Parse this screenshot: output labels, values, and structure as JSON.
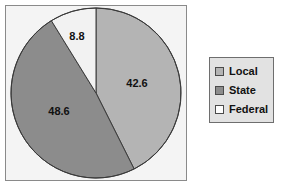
{
  "chart_data": {
    "type": "pie",
    "title": "",
    "subtitle": "",
    "xlabel": "",
    "ylabel": "",
    "grid": false,
    "legend_position": "right",
    "start_angle_deg": 0,
    "direction": "clockwise",
    "categories": [
      "Local",
      "State",
      "Federal"
    ],
    "values": [
      42.6,
      48.6,
      8.8
    ],
    "data_labels": [
      "42.6",
      "48.6",
      "8.8"
    ],
    "slices": [
      {
        "name": "Local",
        "value": 42.6,
        "label": "42.6",
        "color": "#b4b4b4",
        "start_deg": 0,
        "end_deg": 153.36
      },
      {
        "name": "State",
        "value": 48.6,
        "label": "48.6",
        "color": "#8c8c8c",
        "start_deg": 153.36,
        "end_deg": 328.32
      },
      {
        "name": "Federal",
        "value": 8.8,
        "label": "8.8",
        "color": "#f2f2f2",
        "start_deg": 328.32,
        "end_deg": 360
      }
    ]
  },
  "legend": {
    "items": [
      {
        "label": "Local",
        "color": "#b4b4b4"
      },
      {
        "label": "State",
        "color": "#8c8c8c"
      },
      {
        "label": "Federal",
        "color": "#fdfdfd"
      }
    ]
  },
  "colors": {
    "local": "#b4b4b4",
    "state": "#8c8c8c",
    "federal": "#f2f2f2",
    "outline": "#3a3a3a",
    "plot_background": "#f4f4f4",
    "plot_border": "#8a8a8a",
    "legend_background": "#e2e2e2",
    "legend_border": "#6e6e6e",
    "label_text": "#111111",
    "page_background": "#ffffff"
  }
}
